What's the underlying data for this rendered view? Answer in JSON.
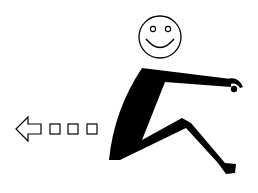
{
  "figure": {
    "colors": {
      "ink": "#000000",
      "background": "#ffffff"
    },
    "motion_indicator": {
      "direction": "left",
      "trail_squares": 3
    }
  }
}
